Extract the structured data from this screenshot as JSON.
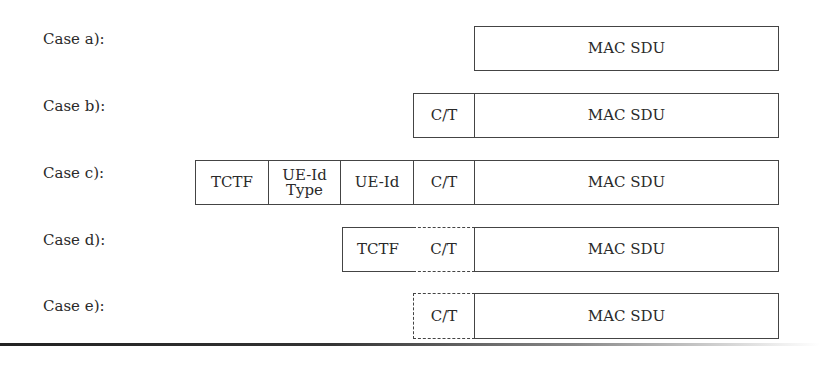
{
  "rows": [
    {
      "label": "Case a):",
      "cells": [
        {
          "text": "MAC SDU"
        }
      ]
    },
    {
      "label": "Case b):",
      "cells": [
        {
          "text": "C/T"
        },
        {
          "text": "MAC SDU"
        }
      ]
    },
    {
      "label": "Case c):",
      "cells": [
        {
          "text": "TCTF"
        },
        {
          "text": "UE-Id Type",
          "line1": "UE-Id",
          "line2": "Type"
        },
        {
          "text": "UE-Id"
        },
        {
          "text": "C/T"
        },
        {
          "text": "MAC SDU"
        }
      ]
    },
    {
      "label": "Case d):",
      "cells": [
        {
          "text": "TCTF"
        },
        {
          "text": "C/T",
          "optional": true
        },
        {
          "text": "MAC SDU"
        }
      ]
    },
    {
      "label": "Case e):",
      "cells": [
        {
          "text": "C/T",
          "optional": true
        },
        {
          "text": "MAC SDU"
        }
      ]
    }
  ]
}
